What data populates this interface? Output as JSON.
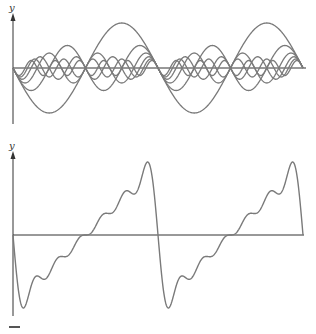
{
  "chart_data": [
    {
      "type": "line",
      "title": "",
      "description": "Individual sine harmonic components",
      "ylabel": "y",
      "xlabel": "",
      "grid": false,
      "legend": "none",
      "x_range_periods": 2,
      "series": [
        {
          "name": "harmonic-1",
          "formula": "-sin(1x)/1",
          "n": 1,
          "amplitude": 1.0
        },
        {
          "name": "harmonic-2",
          "formula": "-sin(2x)/2",
          "n": 2,
          "amplitude": 0.5
        },
        {
          "name": "harmonic-3",
          "formula": "-sin(3x)/3",
          "n": 3,
          "amplitude": 0.333
        },
        {
          "name": "harmonic-4",
          "formula": "-sin(4x)/4",
          "n": 4,
          "amplitude": 0.25
        },
        {
          "name": "harmonic-5",
          "formula": "-sin(5x)/5",
          "n": 5,
          "amplitude": 0.2
        },
        {
          "name": "harmonic-6",
          "formula": "-sin(6x)/6",
          "n": 6,
          "amplitude": 0.167
        }
      ]
    },
    {
      "type": "line",
      "title": "",
      "description": "Sum of harmonics (sawtooth Fourier approximation)",
      "ylabel": "y",
      "xlabel": "",
      "grid": false,
      "legend": "none",
      "x_range_periods": 2,
      "series": [
        {
          "name": "sum",
          "formula": "-sum_{n=1..6} sin(nx)/n"
        }
      ]
    }
  ],
  "labels": {
    "top_y_axis": "y",
    "bottom_y_axis": "y"
  },
  "colors": {
    "curve": "#7a7a7a",
    "axis": "#333333"
  }
}
